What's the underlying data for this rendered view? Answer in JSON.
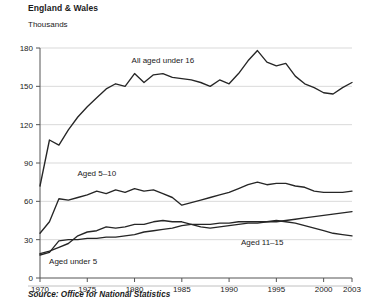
{
  "header": {
    "title": "England & Wales",
    "unit_label": "Thousands"
  },
  "footer": {
    "source": "Source: Office for National Statistics"
  },
  "chart_data": {
    "type": "line",
    "title": "England & Wales",
    "subtitle": "Thousands",
    "xlabel": "",
    "ylabel": "Thousands",
    "xlim": [
      1970,
      2003
    ],
    "ylim": [
      0,
      180
    ],
    "grid": true,
    "legend_position": "inline-labels",
    "yticks": [
      0,
      30,
      60,
      90,
      120,
      150,
      180
    ],
    "xticks": [
      1970,
      1975,
      1980,
      1985,
      1990,
      1995,
      2000,
      2003
    ],
    "ytick_labels": [
      "0",
      "30",
      "60",
      "90",
      "120",
      "150",
      "180"
    ],
    "xtick_labels": [
      "1970",
      "1975",
      "1980",
      "1985",
      "1990",
      "1995",
      "2000",
      "2003"
    ],
    "x": [
      1970,
      1971,
      1972,
      1973,
      1974,
      1975,
      1976,
      1977,
      1978,
      1979,
      1980,
      1981,
      1982,
      1983,
      1984,
      1985,
      1986,
      1987,
      1988,
      1989,
      1990,
      1991,
      1992,
      1993,
      1994,
      1995,
      1996,
      1997,
      1998,
      1999,
      2000,
      2001,
      2002,
      2003
    ],
    "series": [
      {
        "name": "All aged under 16",
        "label": "All aged under 16",
        "values": [
          72,
          108,
          104,
          116,
          126,
          134,
          141,
          148,
          152,
          150,
          160,
          153,
          159,
          160,
          157,
          156,
          155,
          153,
          150,
          155,
          152,
          160,
          170,
          178,
          169,
          166,
          168,
          158,
          152,
          149,
          145,
          144,
          149,
          153
        ]
      },
      {
        "name": "Aged 5-10",
        "label": "Aged 5–10",
        "values": [
          35,
          44,
          62,
          61,
          63,
          65,
          68,
          66,
          69,
          67,
          70,
          68,
          69,
          66,
          63,
          57,
          59,
          61,
          63,
          65,
          67,
          70,
          73,
          75,
          73,
          74,
          74,
          72,
          71,
          68,
          67,
          67,
          67,
          68
        ]
      },
      {
        "name": "Aged 11-15",
        "label": "Aged 11–15",
        "values": [
          19,
          21,
          24,
          27,
          33,
          36,
          37,
          40,
          39,
          40,
          42,
          42,
          44,
          45,
          44,
          44,
          42,
          40,
          39,
          40,
          41,
          42,
          43,
          43,
          44,
          45,
          44,
          43,
          41,
          39,
          37,
          35,
          34,
          33
        ]
      },
      {
        "name": "Aged under 5",
        "label": "Aged under 5",
        "values": [
          18,
          20,
          29,
          30,
          30,
          31,
          31,
          32,
          32,
          33,
          34,
          36,
          37,
          38,
          39,
          41,
          42,
          42,
          42,
          43,
          43,
          44,
          44,
          44,
          44,
          44,
          45,
          46,
          47,
          48,
          49,
          50,
          51,
          52
        ]
      }
    ],
    "annotations": [
      {
        "text": "All aged under 16",
        "x": 1983,
        "y": 168
      },
      {
        "text": "Aged 5–10",
        "x": 1976,
        "y": 80
      },
      {
        "text": "Aged 11–15",
        "x": 1993.5,
        "y": 26
      },
      {
        "text": "Aged under 5",
        "x": 1973.5,
        "y": 11
      }
    ],
    "colors": {
      "line": "#262626",
      "grid": "#cfcfcf",
      "axis": "#555555",
      "text": "#1a1a1a"
    }
  }
}
